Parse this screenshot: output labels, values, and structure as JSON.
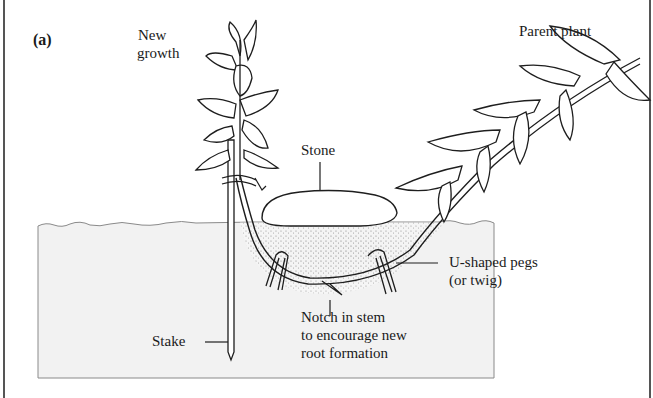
{
  "figure": {
    "panel_label": "(a)",
    "colors": {
      "line": "#1e1e1e",
      "soil": "#f2f2f2",
      "soil_edge": "#8a8a8a",
      "stipple": "#6a6a6a",
      "border": "#555555"
    }
  },
  "labels": {
    "new_growth_1": "New",
    "new_growth_2": "growth",
    "parent_plant": "Parent plant",
    "stone": "Stone",
    "pegs_1": "U-shaped pegs",
    "pegs_2": "(or twig)",
    "stake": "Stake",
    "notch_1": "Notch in stem",
    "notch_2": "to encourage new",
    "notch_3": "root formation"
  }
}
